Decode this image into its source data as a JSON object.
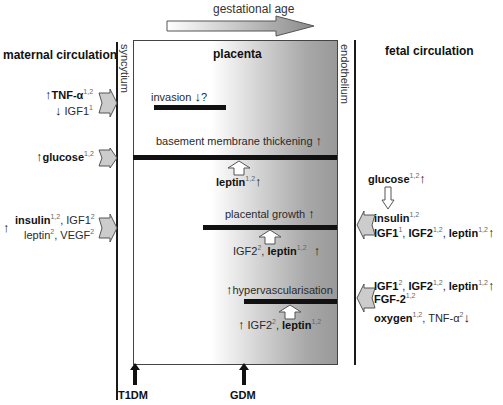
{
  "header": {
    "gestational_age": "gestational age",
    "maternal": "maternal circulation",
    "fetal": "fetal circulation",
    "placenta": "placenta",
    "syncytium": "syncytium",
    "endothelium": "endothelium"
  },
  "placenta_events": {
    "invasion": "invasion",
    "invasion_q": "?",
    "basement": "basement membrane thickening",
    "growth": "placental growth",
    "hypervasc": "hypervascularisation"
  },
  "placenta_factors": {
    "leptin_1": "leptin",
    "leptin_1_sup": "1,2",
    "igf2_a": "IGF2",
    "igf2_a_sup": "2",
    "leptin_2": "leptin",
    "leptin_2_sup": "1,2",
    "igf2_b": "IGF2",
    "igf2_b_sup": "2",
    "leptin_3": "leptin",
    "leptin_3_sup": "1,2"
  },
  "maternal": {
    "tnf": "TNF-α",
    "tnf_sup": "1,2",
    "igf1": "IGF1",
    "igf1_sup": "1",
    "glucose": "glucose",
    "glucose_sup": "1,2",
    "insulin": "insulin",
    "insulin_sup": "1,2",
    "igf1b": "IGF1",
    "igf1b_sup": "2",
    "leptin": "leptin",
    "leptin_sup": "2",
    "vegf": "VEGF",
    "vegf_sup": "2"
  },
  "fetal": {
    "glucose": "glucose",
    "glucose_sup": "1,2",
    "insulin": "insulin",
    "insulin_sup": "1,2",
    "igf1": "IGF1",
    "igf1_sup": "1",
    "igf2": "IGF2",
    "igf2_sup": "1,2",
    "leptin": "leptin",
    "leptin_sup": "1,2",
    "igf1b": "IGF1",
    "igf1b_sup": "2",
    "igf2b": "IGF2",
    "igf2b_sup": "1,2",
    "leptinb": "leptin",
    "leptinb_sup": "1,2",
    "fgf2": "FGF-2",
    "fgf2_sup": "1,2",
    "oxygen": "oxygen",
    "oxygen_sup": "1,2",
    "tnf": "TNF-α",
    "tnf_sup": "2"
  },
  "bottom": {
    "t1dm": "T1DM",
    "gdm": "GDM"
  },
  "colors": {
    "bar": "#111111",
    "arrow_fill": "#c8c8c8",
    "placenta_gradient_end": "#999999"
  }
}
